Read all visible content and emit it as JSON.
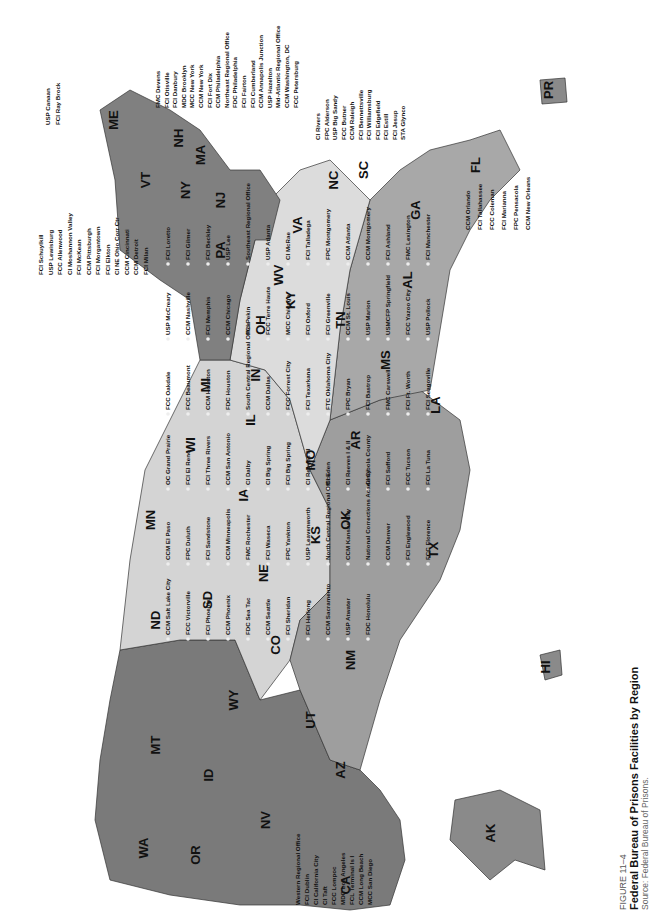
{
  "caption": {
    "figure_label": "FIGURE 11–4",
    "title": "Federal Bureau of Prisons Facilities by Region",
    "source": "Source: Federal Bureau of Prisons."
  },
  "map": {
    "orientation": "rotated 90° counter-clockwise",
    "colors": {
      "dark_region": "#7a7a7a",
      "mid_region": "#a6a6a6",
      "light_region": "#d2d2d2",
      "lightest_region": "#e6e6e6",
      "water": "#ffffff"
    },
    "states": [
      {
        "code": "ME",
        "x": 118,
        "y": 120
      },
      {
        "code": "NH",
        "x": 183,
        "y": 138
      },
      {
        "code": "VT",
        "x": 150,
        "y": 180
      },
      {
        "code": "MA",
        "x": 205,
        "y": 155
      },
      {
        "code": "NY",
        "x": 190,
        "y": 190
      },
      {
        "code": "NJ",
        "x": 225,
        "y": 200
      },
      {
        "code": "PA",
        "x": 225,
        "y": 250
      },
      {
        "code": "OH",
        "x": 265,
        "y": 325
      },
      {
        "code": "MI",
        "x": 210,
        "y": 385
      },
      {
        "code": "WV",
        "x": 283,
        "y": 275
      },
      {
        "code": "VA",
        "x": 302,
        "y": 225
      },
      {
        "code": "NC",
        "x": 338,
        "y": 180
      },
      {
        "code": "SC",
        "x": 368,
        "y": 170
      },
      {
        "code": "GA",
        "x": 420,
        "y": 210
      },
      {
        "code": "FL",
        "x": 480,
        "y": 165
      },
      {
        "code": "KY",
        "x": 295,
        "y": 300
      },
      {
        "code": "TN",
        "x": 345,
        "y": 320
      },
      {
        "code": "AL",
        "x": 412,
        "y": 280
      },
      {
        "code": "MS",
        "x": 390,
        "y": 360
      },
      {
        "code": "LA",
        "x": 440,
        "y": 405
      },
      {
        "code": "IN",
        "x": 260,
        "y": 375
      },
      {
        "code": "IL",
        "x": 255,
        "y": 420
      },
      {
        "code": "WI",
        "x": 195,
        "y": 445
      },
      {
        "code": "MN",
        "x": 155,
        "y": 520
      },
      {
        "code": "IA",
        "x": 248,
        "y": 495
      },
      {
        "code": "MO",
        "x": 315,
        "y": 460
      },
      {
        "code": "AR",
        "x": 360,
        "y": 440
      },
      {
        "code": "OK",
        "x": 350,
        "y": 520
      },
      {
        "code": "TX",
        "x": 438,
        "y": 550
      },
      {
        "code": "KS",
        "x": 320,
        "y": 535
      },
      {
        "code": "NE",
        "x": 268,
        "y": 573
      },
      {
        "code": "SD",
        "x": 212,
        "y": 600
      },
      {
        "code": "ND",
        "x": 160,
        "y": 620
      },
      {
        "code": "CO",
        "x": 280,
        "y": 645
      },
      {
        "code": "NM",
        "x": 355,
        "y": 660
      },
      {
        "code": "WY",
        "x": 238,
        "y": 700
      },
      {
        "code": "MT",
        "x": 160,
        "y": 745
      },
      {
        "code": "UT",
        "x": 315,
        "y": 720
      },
      {
        "code": "AZ",
        "x": 345,
        "y": 770
      },
      {
        "code": "ID",
        "x": 213,
        "y": 775
      },
      {
        "code": "NV",
        "x": 270,
        "y": 820
      },
      {
        "code": "CA",
        "x": 350,
        "y": 885
      },
      {
        "code": "OR",
        "x": 200,
        "y": 855
      },
      {
        "code": "WA",
        "x": 148,
        "y": 848
      },
      {
        "code": "AK",
        "x": 495,
        "y": 833
      },
      {
        "code": "HI",
        "x": 550,
        "y": 667
      },
      {
        "code": "PR",
        "x": 553,
        "y": 90
      }
    ],
    "facilities_northeast": [
      "FMC Devens",
      "FCI Otisville",
      "FCI Danbury",
      "MDC Brooklyn",
      "MCC New York",
      "CCM New York",
      "FCI Fort Dix",
      "CCM Philadelphia",
      "Northeast Regional Office",
      "FDC Philadelphia",
      "FCI Fairton",
      "FCI Cumberland",
      "CCM Annapolis Junction",
      "USP Hazelton",
      "Mid-Atlantic Regional Office",
      "CCM Washington, DC",
      "FCC Petersburg"
    ],
    "facilities_northeast_left": [
      "USP Canaan",
      "FCI Ray Brock"
    ],
    "facilities_midwest_left": [
      "FCI Schuylkill",
      "USP Lewisburg",
      "FCC Allenwood",
      "CI Moshannon Valley",
      "FCI McKean",
      "CCM Pittsburgh",
      "FCI Morgantown",
      "FCI Elkton",
      "CI NE Ohio Corr Ctr",
      "CCM Cincinnati",
      "CCM Detroit",
      "FCI Milan"
    ],
    "facilities_southeast": [
      "CI Rivers",
      "FPC Alderson",
      "USP Big Sandy",
      "FCC Butner",
      "CCM Raleigh",
      "FCI Bennettsville",
      "FCI Williamsburg",
      "FCI Edgefield",
      "FCI Estill",
      "FCI Jesup",
      "STA Glynco"
    ],
    "facilities_florida": [
      "CCM Orlando",
      "FCI Tallahassee",
      "FCC Coleman",
      "FCI Marianna",
      "FPC Pensacola",
      "CCM New Orleans",
      "FDC Miami",
      "CCM Miami",
      "FCI Miami",
      "MDC Guaynabo"
    ],
    "facilities_interior": [
      "FCI Loretto",
      "FCI Gilmer",
      "FCI Beckley",
      "USP Lee",
      "Southeast Regional Office",
      "USP Atlanta",
      "CI McRae",
      "FCI Talladega",
      "FPC Montgomery",
      "CCM Atlanta",
      "CCM Montgomery",
      "FCI Ashland",
      "FMC Lexington",
      "FCI Manchester",
      "USP McCreary",
      "CCM Nashville",
      "FCI Memphis",
      "CCM Chicago",
      "FCI Pekin",
      "FCC Terre Haute",
      "MCC Chicago",
      "FCI Oxford",
      "FCI Greenville",
      "CCM St. Louis",
      "USP Marion",
      "USMCFP Springfield",
      "FCC Yazoo City",
      "USP Pollock",
      "FCC Oakdale",
      "FCC Beaumont",
      "CCM Houston",
      "FDC Houston",
      "South Central Regional Office",
      "CCM Dallas",
      "FCC Forrest City",
      "FCI Texarkana",
      "FTC Oklahoma City",
      "FPC Bryan",
      "FCI Bastrop",
      "FMC Carswell",
      "FCI Ft. Worth",
      "FCI Seagoville",
      "OC Grand Prairie",
      "FCI El Reno",
      "FCI Three Rivers",
      "CCM San Antonio",
      "CI Dalby",
      "CI Big Spring",
      "FCI Big Spring",
      "CI Reeves III",
      "CI Eden",
      "CI Reeves I & II",
      "CI Cibola County",
      "FCI Safford",
      "FCC Tucson",
      "FCI La Tuna",
      "CCM El Paso",
      "FPC Duluth",
      "FCI Sandstone",
      "CCM Minneapolis",
      "FMC Rochester",
      "FCI Waseca",
      "FPC Yankton",
      "USP Leavenworth",
      "North Central Regional Office",
      "CCM Kansas City",
      "National Corrections Academy",
      "CCM Denver",
      "FCI Englewood",
      "FCC Florence",
      "CCM Salt Lake City",
      "FCC Victorville",
      "FCI Phoenix",
      "CCM Phoenix",
      "FDC Sea Tac",
      "CCM Seattle",
      "FCI Sheridan",
      "FCI Herlong",
      "CCM Sacramento",
      "USP Atwater",
      "FDC Honolulu"
    ],
    "facilities_west_bottom": [
      "Western Regional Office",
      "FCI Dublin",
      "CI California City",
      "CI Taft",
      "FCC Lompoc",
      "MDC Los Angeles",
      "FCL Terminal Is I",
      "CCM Long Beach",
      "MCC San Diego"
    ]
  }
}
